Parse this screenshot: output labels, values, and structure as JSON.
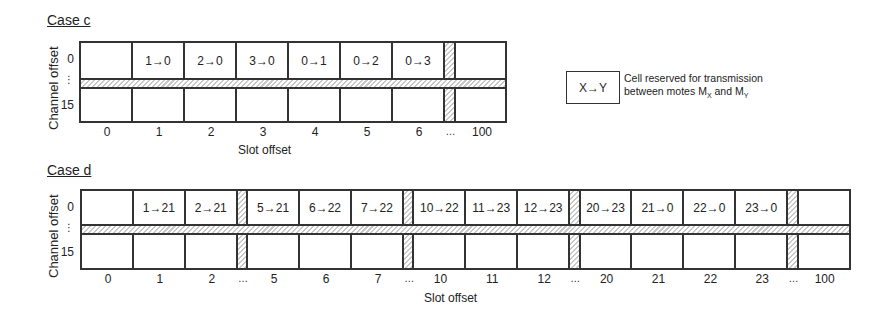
{
  "case_c": {
    "title": "Case c",
    "y_axis_title": "Channel offset",
    "x_axis_title": "Slot offset",
    "channel_labels": [
      "0",
      "⋮",
      "15"
    ],
    "columns": [
      {
        "slot": "0",
        "cell_ch0": ""
      },
      {
        "slot": "1",
        "cell_ch0": "1→0"
      },
      {
        "slot": "2",
        "cell_ch0": "2→0"
      },
      {
        "slot": "3",
        "cell_ch0": "3→0"
      },
      {
        "slot": "4",
        "cell_ch0": "0→1"
      },
      {
        "slot": "5",
        "cell_ch0": "0→2"
      },
      {
        "slot": "6",
        "cell_ch0": "0→3"
      },
      {
        "slot": "…",
        "gap": true
      },
      {
        "slot": "100",
        "cell_ch0": ""
      }
    ]
  },
  "case_d": {
    "title": "Case d",
    "y_axis_title": "Channel offset",
    "x_axis_title": "Slot offset",
    "channel_labels": [
      "0",
      "⋮",
      "15"
    ],
    "columns": [
      {
        "slot": "0",
        "cell_ch0": ""
      },
      {
        "slot": "1",
        "cell_ch0": "1→21"
      },
      {
        "slot": "2",
        "cell_ch0": "2→21"
      },
      {
        "slot": "…",
        "gap": true
      },
      {
        "slot": "5",
        "cell_ch0": "5→21"
      },
      {
        "slot": "6",
        "cell_ch0": "6→22"
      },
      {
        "slot": "7",
        "cell_ch0": "7→22"
      },
      {
        "slot": "…",
        "gap": true
      },
      {
        "slot": "10",
        "cell_ch0": "10→22"
      },
      {
        "slot": "11",
        "cell_ch0": "11→23"
      },
      {
        "slot": "12",
        "cell_ch0": "12→23"
      },
      {
        "slot": "…",
        "gap": true
      },
      {
        "slot": "20",
        "cell_ch0": "20→23"
      },
      {
        "slot": "21",
        "cell_ch0": "21→0"
      },
      {
        "slot": "22",
        "cell_ch0": "22→0"
      },
      {
        "slot": "23",
        "cell_ch0": "23→0"
      },
      {
        "slot": "…",
        "gap": true
      },
      {
        "slot": "100",
        "cell_ch0": ""
      }
    ]
  },
  "legend": {
    "symbol": "X→Y",
    "line1": "Cell reserved for transmission",
    "line2_prefix": "between motes M",
    "sub_x": "X",
    "and": " and M",
    "sub_y": "Y"
  }
}
